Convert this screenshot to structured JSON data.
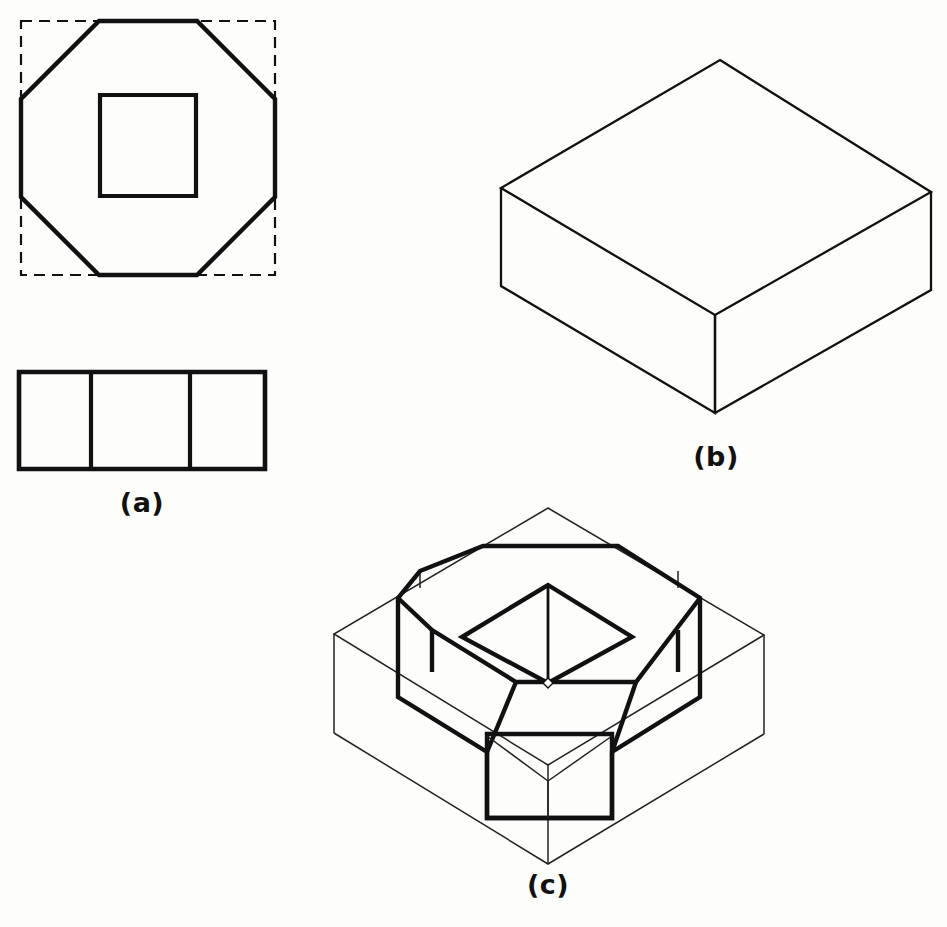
{
  "figure": {
    "background_color": "#fdfdfb",
    "line_color": "#111111",
    "thick_stroke": 4.2,
    "medium_stroke": 3.0,
    "thin_stroke": 1.4,
    "dash_pattern": "11,7",
    "panels": [
      {
        "id": "a",
        "label": "(a)",
        "label_x": 142,
        "label_y": 512,
        "description": "orthographic multiview: top view octagon inside dashed square with square hole, plus front view rectangle divided into three parts"
      },
      {
        "id": "b",
        "label": "(b)",
        "label_x": 716,
        "label_y": 466,
        "description": "isometric pictorial of plain rectangular block"
      },
      {
        "id": "c",
        "label": "(c)",
        "label_x": 548,
        "label_y": 894,
        "description": "isometric pictorial of octagonal prism with square hole, construction box shown in thin lines"
      }
    ],
    "shapes": {
      "a_dashed_square": {
        "name": "construction-square-dashed",
        "points": "21,21 275,21 275,275 21,275",
        "stroke": 2.2,
        "dashed": true
      },
      "a_octagon": {
        "name": "top-view-octagon",
        "points": "99,21 197,21 275,99 275,197 197,275 99,275 21,197 21,99",
        "stroke": 4.2
      },
      "a_inner_square": {
        "name": "top-view-square-hole",
        "points": "100,95 196,95 196,196 100,196",
        "stroke": 4.2
      },
      "a_front_rect": {
        "name": "front-view-rectangle",
        "points": "19,372 265,372 265,469 19,469",
        "stroke": 4.2
      },
      "a_front_dividers": {
        "name": "front-view-dividers",
        "x_positions": [
          91,
          190
        ],
        "y_top": 372,
        "y_bottom": 469,
        "stroke": 4.0
      },
      "b_block": {
        "name": "isometric-block",
        "top_face": "720,60 931,192 715,315 501,188",
        "front_left_face": "501,188 715,315 715,413 501,286",
        "front_right_face": "715,315 931,192 931,290 715,413",
        "stroke": 2.2
      },
      "c_construction_box": {
        "name": "construction-box-thin",
        "top_face": "548,508 764,635 548,765 334,634",
        "left_vertical": "334,634 334,733",
        "front_vertical": "548,765 548,864",
        "right_vertical": "764,635 764,734",
        "bottom_left_edge": "334,733 548,864",
        "bottom_right_edge": "548,864 764,734",
        "stroke": 1.4
      },
      "c_octagon_top": {
        "name": "isometric-octagon-top-face",
        "points": "483,546 618,546 700,598 636,682 516,682 432,630 398,598 420,571",
        "stroke": 4.2
      },
      "c_prism_verticals": {
        "name": "octagonal-prism-vertical-edges",
        "edges": [
          {
            "x": 398,
            "y1": 598,
            "y2": 697
          },
          {
            "x": 487,
            "y1": 728,
            "y2": 818
          },
          {
            "x": 612,
            "y1": 728,
            "y2": 818
          },
          {
            "x": 700,
            "y1": 598,
            "y2": 697
          }
        ],
        "stroke": 4.2
      },
      "c_inner_diamond": {
        "name": "square-hole-top-opening",
        "points": "548,585 632,637 548,683 462,637",
        "stroke": 4.2
      },
      "c_hole_center_line": {
        "name": "hole-internal-vertical-edge",
        "x": 548,
        "y1": 585,
        "y2": 683,
        "stroke": 2.6
      },
      "c_hole_dot": {
        "name": "hole-bottom-corner-marker",
        "cx": 548,
        "cy": 683,
        "size": 5
      },
      "c_front_face_v": {
        "name": "front-face-v-edges",
        "left": "487,734 548,781",
        "right": "612,734 548,781",
        "center": "548,781 548,818",
        "stroke": 1.4
      }
    }
  }
}
